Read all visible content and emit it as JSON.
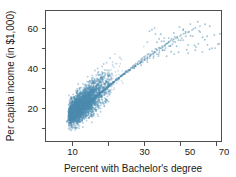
{
  "chart_data": {
    "type": "scatter",
    "title": "",
    "xlabel": "Percent with Bachelor's degree",
    "ylabel": "Per capita income (in $1,000)",
    "xlim": [
      4,
      76
    ],
    "ylim": [
      5,
      68
    ],
    "xticks": [
      10,
      30,
      50,
      70
    ],
    "xticks_minor": [
      20,
      40,
      60
    ],
    "yticks": [
      20,
      40,
      60
    ],
    "grid": false,
    "legend": null,
    "marker": {
      "color": "#4f8cb0",
      "shape": "circle",
      "size_px": 1.9,
      "opacity": 0.55
    },
    "n_points": 3140,
    "x": [
      8.2,
      9.1,
      7.6,
      10.4,
      11.2,
      8.8,
      9.6,
      12.1,
      10.8,
      7.9,
      13.4,
      11.7,
      9.3,
      8.5,
      14.2,
      12.8,
      10.1,
      9.9,
      11.4,
      13.1,
      8.1,
      10.6,
      12.3,
      9.4,
      15.1,
      13.8,
      11.1,
      10.2,
      8.7,
      12.6,
      14.7,
      11.9,
      9.8,
      13.3,
      16.2,
      12.2,
      10.5,
      9.2,
      11.6,
      14.1,
      15.8,
      12.9,
      10.9,
      13.7,
      17.1,
      11.3,
      9.7,
      12.4,
      15.3,
      13.2,
      10.7,
      11.8,
      16.5,
      14.4,
      12.1,
      9.5,
      13.9,
      17.6,
      15.2,
      11.5,
      10.3,
      14.8,
      18.2,
      12.7,
      13.5,
      16.1,
      11.2,
      15.6,
      19.1,
      13.4,
      12.0,
      17.3,
      14.9,
      10.8,
      16.8,
      18.7,
      13.1,
      11.7,
      15.4,
      20.2,
      14.2,
      12.5,
      17.9,
      16.3,
      13.8,
      11.4,
      19.6,
      15.1,
      12.8,
      18.4,
      21.1,
      14.6,
      13.2,
      16.9,
      20.7,
      15.8,
      12.2,
      17.5,
      22.3,
      14.1,
      13.6,
      19.2,
      16.4,
      11.9,
      18.8,
      21.6,
      15.3,
      13.9,
      20.1,
      23.4,
      16.7,
      14.3,
      17.8,
      22.1,
      15.9,
      13.1,
      19.7,
      24.2,
      16.2,
      14.8,
      21.3,
      18.1,
      15.4,
      12.7,
      23.1,
      17.2,
      14.5,
      20.6,
      25.3,
      16.8,
      13.4,
      22.7,
      18.9,
      15.7,
      24.1,
      21.8,
      17.4,
      14.2,
      26.2,
      19.3,
      16.1,
      23.6,
      20.4,
      17.9,
      15.2,
      25.7,
      22.4,
      18.3,
      14.9,
      27.1,
      20.9,
      16.5,
      24.8,
      21.2,
      18.6,
      15.8,
      28.3,
      23.2,
      19.1,
      16.3,
      26.4,
      22.8,
      17.7,
      25.1,
      29.2,
      20.3,
      16.9,
      23.9,
      27.6,
      21.7,
      18.2,
      30.1,
      24.6,
      19.8,
      17.1,
      28.9,
      22.3,
      18.9,
      26.8,
      31.4,
      20.7,
      17.6,
      25.4,
      29.8,
      23.1,
      19.4,
      32.2,
      27.2,
      21.1,
      18.4,
      30.6,
      24.3,
      20.2,
      28.1,
      33.7,
      22.6,
      19.1,
      26.9,
      31.8,
      24.9,
      21.4,
      35.1,
      29.3,
      22.2,
      19.8,
      32.9,
      25.7,
      21.8,
      30.2,
      36.4,
      23.8,
      20.6,
      28.7,
      34.2,
      26.3,
      22.9,
      37.8,
      31.1,
      24.1,
      21.2,
      35.6,
      27.4,
      23.4,
      32.6,
      39.1,
      25.2,
      22.1,
      30.8,
      37.2,
      28.1,
      24.6,
      40.3,
      33.4,
      26.1,
      23.2,
      38.6,
      29.2,
      25.3,
      35.2,
      41.7,
      27.2,
      24.1,
      33.1,
      39.8,
      30.4,
      26.8,
      43.2,
      36.1,
      28.3,
      25.1,
      41.2,
      31.6,
      27.1,
      38.1,
      44.6,
      29.4,
      26.2,
      35.8,
      42.4,
      32.2,
      28.6,
      46.1,
      39.2,
      30.1,
      27.3,
      44.1,
      33.8,
      29.2,
      41.1,
      47.3,
      31.4,
      28.1,
      38.6,
      45.2,
      34.6,
      30.8,
      48.7,
      42.1,
      32.1,
      29.4,
      46.8,
      36.2,
      31.2,
      43.8,
      50.1,
      33.7,
      30.2,
      41.2,
      48.2,
      37.1,
      33.4,
      51.6,
      45.1,
      35.2,
      31.8,
      49.4,
      38.6,
      33.9,
      46.2,
      53.1,
      36.1,
      32.6,
      43.7,
      50.8,
      39.8,
      35.7,
      54.8,
      47.6,
      37.4,
      34.1,
      52.2,
      41.2,
      36.2,
      48.8,
      56.3,
      38.7,
      34.8,
      45.9,
      53.6,
      42.4,
      38.1,
      58.1,
      50.2,
      40.1,
      36.4,
      55.2,
      43.8,
      38.6,
      51.6,
      59.8,
      41.2,
      37.1,
      48.4,
      57.1,
      44.6,
      40.2,
      61.2,
      52.8,
      42.1,
      38.4,
      58.6,
      46.2,
      41.1,
      54.2,
      63.1,
      43.7,
      39.2,
      50.8,
      60.4,
      47.1,
      42.6,
      65.2,
      55.6,
      44.2,
      40.1,
      62.2,
      48.6,
      43.1,
      57.2,
      67.1,
      45.8,
      41.2,
      53.4,
      64.1,
      49.2,
      44.6,
      69.4,
      58.2,
      46.1,
      42.1,
      66.2,
      51.1,
      45.2,
      60.1,
      71.2,
      47.6,
      43.1,
      56.2,
      68.1,
      52.4,
      46.8,
      70.6,
      61.2,
      48.2,
      44.2,
      73.1,
      54.2,
      47.1,
      63.2,
      49.8,
      45.1,
      59.2,
      56.1,
      50.2,
      46.2,
      65.1,
      52.2,
      48.1,
      61.4,
      67.2,
      53.8,
      49.2,
      57.6,
      62.8,
      55.1,
      50.8,
      69.1,
      59.1,
      52.1,
      47.6,
      64.2,
      56.2,
      51.2,
      60.8,
      71.4,
      54.6,
      50.1,
      58.2,
      66.1,
      57.1,
      52.6,
      62.4,
      68.2,
      55.8,
      51.4,
      60.2,
      64.6,
      58.2,
      53.1,
      70.2,
      61.8,
      56.1,
      52.2,
      66.8,
      59.2,
      54.2,
      63.1,
      72.1,
      57.6,
      53.2,
      61.2,
      68.6,
      60.1,
      55.2,
      65.2,
      70.8,
      58.6,
      54.1,
      62.8,
      67.2,
      61.2,
      56.2
    ],
    "y": [
      14.2,
      15.1,
      13.4,
      16.2,
      17.1,
      14.8,
      15.6,
      18.2,
      16.8,
      13.9,
      19.4,
      17.7,
      15.3,
      14.5,
      20.2,
      18.8,
      16.1,
      15.9,
      17.4,
      19.1,
      14.1,
      16.6,
      18.3,
      15.4,
      21.1,
      19.8,
      17.1,
      16.2,
      14.7,
      18.6,
      20.7,
      17.9,
      15.8,
      19.3,
      22.2,
      18.2,
      16.5,
      15.2,
      17.6,
      20.1,
      21.8,
      18.9,
      16.9,
      19.7,
      23.1,
      17.3,
      15.7,
      18.4,
      21.3,
      19.2,
      16.7,
      17.8,
      22.5,
      20.4,
      18.1,
      15.5,
      19.9,
      23.6,
      21.2,
      17.5,
      16.3,
      20.8,
      24.2,
      18.7,
      19.5,
      22.1,
      17.2,
      21.6,
      25.1,
      19.4,
      18.0,
      23.3,
      20.9,
      16.8,
      22.8,
      24.7,
      19.1,
      17.7,
      21.4,
      26.2,
      20.2,
      18.5,
      23.9,
      22.3,
      19.8,
      17.4,
      25.6,
      21.1,
      18.8,
      24.4,
      27.1,
      20.6,
      19.2,
      22.9,
      26.7,
      21.8,
      18.2,
      23.5,
      28.3,
      20.1,
      19.6,
      25.2,
      22.4,
      17.9,
      24.8,
      27.6,
      21.3,
      19.9,
      26.1,
      29.4,
      22.7,
      20.3,
      23.8,
      28.1,
      21.9,
      19.1,
      25.7,
      30.2,
      22.2,
      20.8,
      27.3,
      24.1,
      21.4,
      18.7,
      29.1,
      23.2,
      20.5,
      26.6,
      31.3,
      22.8,
      19.4,
      28.7,
      24.9,
      21.7,
      30.1,
      27.8,
      23.4,
      20.2,
      32.2,
      25.3,
      22.1,
      29.6,
      26.4,
      23.9,
      21.2,
      31.7,
      28.4,
      24.3,
      20.9,
      33.1,
      26.9,
      22.5,
      30.8,
      27.2,
      24.6,
      21.8,
      34.2,
      29.2,
      25.1,
      22.3,
      32.4,
      28.8,
      23.7,
      31.1,
      35.2,
      26.3,
      22.9,
      29.9,
      33.6,
      27.7,
      24.2,
      36.1,
      30.6,
      25.8,
      23.1,
      34.9,
      28.3,
      24.9,
      32.8,
      37.4,
      26.7,
      23.6,
      31.4,
      35.8,
      29.1,
      25.4,
      38.2,
      33.2,
      27.1,
      24.4,
      36.6,
      30.3,
      26.2,
      34.6,
      39.1,
      28.6,
      25.1,
      32.9,
      37.8,
      30.9,
      27.4,
      41.1,
      35.3,
      28.2,
      25.8,
      38.9,
      31.7,
      27.8,
      36.2,
      42.4,
      29.8,
      26.6,
      34.7,
      40.2,
      32.3,
      28.9,
      43.8,
      37.1,
      30.1,
      27.2,
      41.6,
      33.4,
      29.4,
      38.6,
      45.1,
      31.2,
      28.1,
      36.8,
      43.2,
      34.1,
      30.6,
      46.2,
      39.4,
      32.1,
      29.2,
      44.6,
      35.2,
      31.4,
      40.8,
      47.3,
      33.2,
      30.1,
      38.2,
      45.8,
      36.1,
      32.8,
      48.6,
      41.2,
      34.2,
      31.1,
      46.9,
      37.4,
      33.1,
      42.6,
      49.8,
      35.4,
      32.2,
      40.1,
      47.2,
      38.6,
      34.8,
      50.4,
      43.1,
      36.2,
      33.2,
      48.4,
      39.2,
      35.1,
      44.2,
      51.2,
      37.2,
      34.1,
      41.6,
      49.1,
      40.4,
      36.6,
      52.1,
      45.2,
      38.2,
      35.2,
      50.2,
      41.2,
      37.1,
      46.1,
      53.4,
      39.4,
      36.2,
      43.2,
      51.4,
      42.1,
      38.8,
      54.2,
      47.2,
      40.2,
      37.2,
      52.6,
      43.4,
      39.1,
      48.1,
      55.1,
      41.6,
      38.2,
      45.2,
      53.8,
      44.2,
      40.6,
      56.2,
      49.1,
      42.2,
      39.2,
      54.6,
      45.2,
      41.1,
      50.2,
      57.4,
      43.8,
      40.2,
      47.1,
      55.9,
      46.2,
      42.6,
      58.1,
      51.2,
      44.2,
      41.2,
      56.8,
      47.4,
      43.1,
      52.1,
      59.2,
      45.6,
      42.2,
      49.1,
      57.6,
      48.2,
      44.6,
      60.4,
      53.2,
      46.2,
      43.2,
      58.4,
      49.2,
      45.1,
      54.1,
      61.2,
      47.6,
      44.2,
      51.2,
      59.8,
      50.2,
      46.6,
      62.1,
      55.2,
      48.2,
      45.2,
      63.4,
      51.4,
      47.1,
      56.1,
      49.6,
      46.2,
      53.2,
      51.1,
      48.2,
      46.1,
      57.2,
      50.2,
      47.6,
      54.8,
      58.6,
      51.8,
      48.4,
      53.1,
      56.2,
      52.4,
      49.2,
      59.4,
      54.2,
      50.1,
      47.2,
      57.1,
      52.1,
      49.1,
      55.2,
      60.2,
      51.2,
      48.1,
      53.6,
      58.2,
      52.8,
      49.6,
      56.4,
      59.1,
      53.2,
      50.2,
      54.4,
      57.8,
      53.6,
      50.8,
      61.1,
      55.4,
      52.2,
      49.4,
      58.8,
      54.1,
      51.2,
      56.8,
      62.2,
      53.4,
      50.6,
      55.6,
      59.6,
      54.8,
      51.6,
      57.4,
      60.8,
      55.2,
      51.8,
      56.1,
      58.4,
      55.8,
      52.4
    ]
  },
  "axis": {
    "ylabel": "Per capita income (in $1,000)",
    "xlabel": "Percent with Bachelor's degree",
    "ytick_labels": [
      "60",
      "40",
      "20"
    ],
    "xtick_labels": [
      "10",
      "30",
      "50",
      "70"
    ]
  }
}
